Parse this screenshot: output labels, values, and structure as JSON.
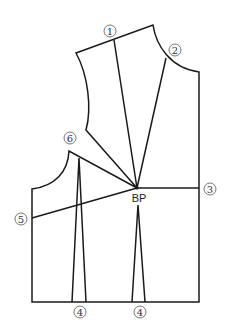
{
  "diagram": {
    "title": "",
    "labels": {
      "l1": "1",
      "l2": "2",
      "l3": "3",
      "l4a": "4",
      "l4b": "4",
      "l5": "5",
      "l6": "6",
      "bp": "BP"
    },
    "stroke_color": "#1a1a1a",
    "background": "#ffffff"
  }
}
